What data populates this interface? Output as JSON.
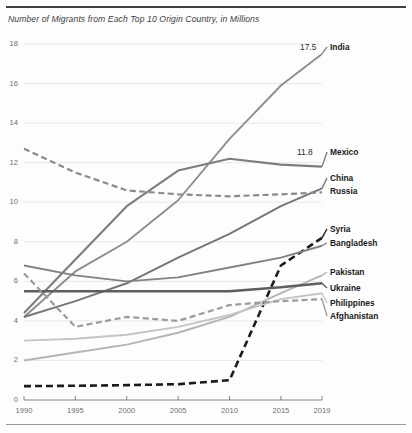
{
  "chart": {
    "title": "Number of Migrants from Each Top 10 Origin Country, in Millions"
  },
  "chart_data": {
    "type": "line",
    "title": "Number of Migrants from Each Top 10 Origin Country, in Millions",
    "xlabel": "",
    "ylabel": "",
    "x": [
      1990,
      1995,
      2000,
      2005,
      2010,
      2015,
      2019
    ],
    "xlim": [
      1990,
      2019
    ],
    "ylim": [
      0,
      18
    ],
    "yticks": [
      0,
      2,
      4,
      6,
      8,
      10,
      12,
      14,
      16,
      18
    ],
    "xticks": [
      "1990",
      "1995",
      "2000",
      "2005",
      "2010",
      "2015",
      "2019"
    ],
    "grid": true,
    "legend": "right-inline-labels",
    "series": [
      {
        "name": "India",
        "values": [
          4.2,
          6.5,
          8.0,
          10.1,
          13.2,
          15.9,
          17.5
        ],
        "color": "#8e8e8e",
        "dash": "solid",
        "width": 1.9,
        "end_label": "India",
        "end_value": "17.5"
      },
      {
        "name": "Mexico",
        "values": [
          4.4,
          7.1,
          9.8,
          11.6,
          12.2,
          11.9,
          11.8
        ],
        "color": "#7d7d7d",
        "dash": "solid",
        "width": 2.1,
        "end_label": "Mexico",
        "end_value": "11.8"
      },
      {
        "name": "China",
        "values": [
          4.2,
          5.0,
          5.9,
          7.2,
          8.4,
          9.8,
          10.7
        ],
        "color": "#767676",
        "dash": "solid",
        "width": 2.0,
        "end_label": "China",
        "end_value": ""
      },
      {
        "name": "Russia",
        "values": [
          12.7,
          11.5,
          10.6,
          10.4,
          10.3,
          10.4,
          10.5
        ],
        "color": "#8a8a8a",
        "dash": "dashed",
        "width": 2.2,
        "end_label": "Russia",
        "end_value": ""
      },
      {
        "name": "Syria",
        "values": [
          0.7,
          0.72,
          0.75,
          0.8,
          1.0,
          6.8,
          8.2
        ],
        "color": "#1c1c1c",
        "dash": "dashed",
        "width": 2.6,
        "end_label": "Syria",
        "end_value": ""
      },
      {
        "name": "Bangladesh",
        "values": [
          6.8,
          6.3,
          6.0,
          6.2,
          6.7,
          7.2,
          7.8
        ],
        "color": "#828282",
        "dash": "solid",
        "width": 1.9,
        "end_label": "Bangladesh",
        "end_value": ""
      },
      {
        "name": "Pakistan",
        "values": [
          2.0,
          2.4,
          2.8,
          3.4,
          4.2,
          5.4,
          6.3
        ],
        "color": "#b4b4b4",
        "dash": "solid",
        "width": 1.9,
        "end_label": "Pakistan",
        "end_value": ""
      },
      {
        "name": "Ukraine",
        "values": [
          5.5,
          5.5,
          5.5,
          5.5,
          5.5,
          5.7,
          5.9
        ],
        "color": "#5e5e5e",
        "dash": "solid",
        "width": 2.4,
        "end_label": "Ukraine",
        "end_value": ""
      },
      {
        "name": "Philippines",
        "values": [
          3.0,
          3.1,
          3.3,
          3.7,
          4.3,
          5.1,
          5.4
        ],
        "color": "#c4c4c4",
        "dash": "solid",
        "width": 1.9,
        "end_label": "Philippines",
        "end_value": ""
      },
      {
        "name": "Afghanistan",
        "values": [
          6.4,
          3.7,
          4.2,
          4.0,
          4.8,
          5.0,
          5.1
        ],
        "color": "#9b9b9b",
        "dash": "dashed",
        "width": 2.2,
        "end_label": "Afghanistan",
        "end_value": ""
      }
    ],
    "annotations": [
      {
        "text": "17.5",
        "series": "India"
      },
      {
        "text": "11.8",
        "series": "Mexico"
      }
    ]
  }
}
